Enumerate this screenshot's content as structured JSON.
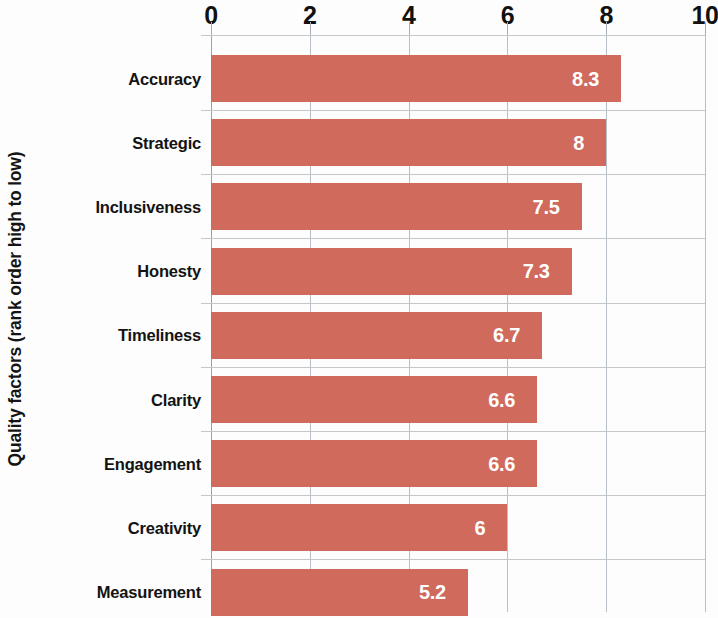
{
  "chart_data": {
    "type": "bar",
    "orientation": "horizontal",
    "title": "",
    "xlabel": "",
    "ylabel": "Quality factors (rank order high to low)",
    "xlim": [
      0,
      10
    ],
    "xticks": [
      0,
      2,
      4,
      6,
      8,
      10
    ],
    "xtick_labels": [
      "0",
      "2",
      "4",
      "6",
      "8",
      "10"
    ],
    "grid": true,
    "legend": false,
    "bar_color": "#cf6a5c",
    "value_label_color": "#ffffff",
    "gridline_color": "#c3c8cd",
    "categories": [
      "Accuracy",
      "Strategic",
      "Inclusiveness",
      "Honesty",
      "Timeliness",
      "Clarity",
      "Engagement",
      "Creativity",
      "Measurement"
    ],
    "values": [
      8.3,
      8,
      7.5,
      7.3,
      6.7,
      6.6,
      6.6,
      6,
      5.2
    ],
    "value_labels": [
      "8.3",
      "8",
      "7.5",
      "7.3",
      "6.7",
      "6.6",
      "6.6",
      "6",
      "5.2"
    ]
  }
}
